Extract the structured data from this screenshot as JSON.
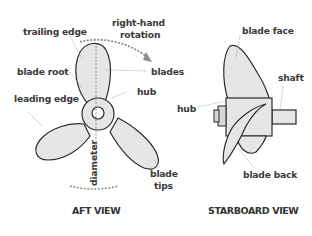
{
  "aft_view": {
    "title": "AFT VIEW",
    "labels": {
      "trailing_edge": "trailing edge",
      "rotation_line1": "right-hand",
      "rotation_line2": "rotation",
      "blade_root": "blade root",
      "blades": "blades",
      "hub": "hub",
      "leading_edge": "leading edge",
      "diameter": "diameter",
      "blade_tips_line1": "blade",
      "blade_tips_line2": "tips"
    }
  },
  "starboard_view": {
    "title": "STARBOARD VIEW",
    "labels": {
      "blade_face": "blade face",
      "shaft": "shaft",
      "hub": "hub",
      "blade_back": "blade back"
    }
  },
  "colors": {
    "blade_fill": "#e6e6e6",
    "outline": "#2b2b2b",
    "leader_line": "#9a9a9a",
    "rotation_arrow": "#8c8c8c",
    "text": "#3a3a3a"
  }
}
